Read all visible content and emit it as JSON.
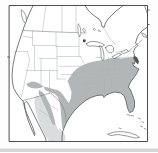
{
  "meta": {
    "type": "range-map"
  },
  "colors": {
    "background": "#fdfdfd",
    "map_interior": "#ffffff",
    "frame": "#4d4d4d",
    "coastline": "#565b5b",
    "state_lines": "#abb0b0",
    "international_border": "#7e8383",
    "primary_range_fill": "#b2b6b6",
    "secondary_range_fill": "#d9dddd",
    "dark_marker": "#3c4040",
    "coastal_patch": "#4f5454",
    "bottom_strip": "#d7d7d7"
  },
  "legend": {
    "primary_range": {
      "color": "#b2b6b6",
      "regions": [
        "southeastern United States",
        "eastern and central US west to the Great Plains",
        "Atlantic coast north to New Jersey",
        "Texas (except western wedge)",
        "southern Arizona and New Mexico",
        "northern Mexico and Sierra Madre"
      ]
    },
    "secondary_range": {
      "color": "#d9dddd",
      "regions": [
        "interior Mexico"
      ]
    },
    "point_markers": [
      {
        "name": "isolated-record-marker-northern-minnesota",
        "color": "#3c4040"
      },
      {
        "name": "dark-coastal-patch-new-jersey",
        "color": "#4f5454"
      }
    ]
  },
  "map": {
    "viewBox": "0 0 158 152",
    "layers": [
      {
        "name": "page-background",
        "d": "M0,0H158V152H0Z",
        "fill": "#fdfdfd"
      },
      {
        "name": "bottom-edge-strip",
        "d": "M0,148.5H158V152H0Z",
        "fill": "#d7d7d7"
      },
      {
        "name": "map-interior",
        "d": "M9.5,5.5H147.5V141.5H9.5Z",
        "fill": "#ffffff"
      },
      {
        "name": "range-secondary-mexico",
        "d": "M37,95 L41,98 L44,102 L47,107 L50,113 L53,119 L56,125 L59,131 L61,136 L61,141.5 L49,141.5 L45,135 L41,127 L38,119 L35.5,111 L34.5,103 L35,97 Z M59,128 L62,130 L64,133 L65.5,137 L65,141.5 L60,141.5 Z",
        "fill": "#d9dddd"
      },
      {
        "name": "range-primary-main",
        "d": "M134,57 L128,57.5 L121,58.5 L114,57.5 L107,59 L100,60.5 L94,61.5 L88,63 L82,65.5 L77,68.5 L73,72.5 L70,77 L67.5,81 L69.5,86 L71.5,92 L71,98 L69,103 L66.5,100 L63.5,95.5 L60.5,92 L57.5,90 L53,89 L48,87.5 L43.5,86.5 L45,90 L50,92 L55,94 L58,97 L59.5,102 L60.5,108 L61,114 L61.5,120 L62,126 L63,130 L64.5,127 L66.5,122.5 L70,116.5 L74.5,110.5 L80,105 L85.5,100.5 L91,97.5 L97,95.5 L102.5,95 L104,97.5 L105.5,95.5 L109.5,93.5 L115,92 L120.5,93 L124,95.5 L126,101 L127.5,108 L129.5,112.5 L132.5,111.5 L134.5,107 L134.5,101 L132.5,95 L130.5,90 L128.5,87 L129.5,84 L132,80 L135,76 L137.5,72 L139,69 L136,67.5 L133.5,66 L132.5,62.5 L134.5,64 L135,60.5 L133.5,58.5 Z",
        "fill": "#b2b6b6"
      },
      {
        "name": "range-primary-southwest",
        "d": "M28,83 L32,81.5 L36,82 L40,84 L43.5,86.5 L40,88 L36,88.5 L31.5,88 L28,86.5 L26.5,84.5 Z",
        "fill": "#b2b6b6"
      },
      {
        "name": "range-primary-sierra-madre",
        "d": "M39,90 L43,92.5 L46,97 L48.5,102 L51,108 L53,114 L54.5,120 L55.5,125.5 L52.5,124 L50,118.5 L47.5,112 L44.5,105.5 L41.5,99 L38.5,93.5 Z",
        "fill": "#b2b6b6"
      },
      {
        "name": "state-boundaries",
        "d": "M23.5,36.5 L33,37.5 M32.5,31 L32.5,45.5 M14.5,51.5 L28,51.5 M27.5,51.5 L29.5,60 L21.5,96.5 M34.5,45.5 L34.5,70.5 M33,45.5 L56,45.5 M56,33 L56,45.5 M57,45.5 L57,70.5 M39,58.5 L57,58.5 M41,58.5 L41,88 M26,70.5 L41,70.5 M41,70.5 L57,70.5 M49.5,70.5 L49.5,93.5 M57,70.5 L57,79 M57,79 L66,79 M56,46.5 L79,46.5 M57,56.5 L80.5,56.5 M79,33.5 L79,56.5 M60,66.5 L81,66 M80.5,56.5 L84,63.5 M61,74.5 L80,74.5 M84,70.5 L84,83.5 M84,77.5 L99,77.5 M84,83.5 L97.5,83.5 M86.5,83.5 L86.5,97.5 M97.5,83.5 L97.5,94.5 M104.5,77.5 L104.5,93.5 M111,75.5 L112,91 M98,71 L122,69 M98,75.5 L118,73.5 M96,57.5 L103,57.5 M103,57.5 L103,70.5 M108.5,57.5 L108.5,70 M114.5,56.5 L114.5,68 M116,57.5 L133,57 M116,52 L131,51 M118,68 L136,66 M117,74 L129,78.5 M112,91 L127,91 M62,5.5 L62,31.5 M76,5.5 L76,32.5 M46,5.5 L42.5,31 M103.5,27.5 L109.5,38 L116,45 M47,103 L58,110 M40,110 L52,119",
        "stroke": "#abb0b0",
        "strokeWidth": 0.5
      },
      {
        "name": "international-borders",
        "d": "M23.5,30.5 L45,31.5 L66,32.3 L86,33 M23,100.5 L31,98.5 L39,96.3 L46,94.3 L50.5,93 L54,96 L57.5,99 L60.5,102.5 L63,107 L64.8,112 L65.8,117.5 L66.3,123",
        "stroke": "#7e8383",
        "strokeWidth": 0.6
      },
      {
        "name": "st-lawrence-line",
        "d": "M128.5,51.5 L133,47.5 L138,43.5 L142,40",
        "stroke": "#6a6f6f",
        "strokeWidth": 0.5
      },
      {
        "name": "pacific-coastline",
        "d": "M33,5.5 L30,12 L27,19 L24,27 L21,36 L18,45 L15,55 L13,65 L12,75 L12.5,83 L14,89 L17,94 L20,98 L23,101 L24.5,107 L27,114 L30,121 L33,128 L35,134 L34.5,135.5 L32.5,131 L29.5,124 L27,117 L25,109 L24.5,103 L26,101.5 L28,103 L30,107 L33,113 L36,119 L39,125 L42,131 L45,137 L46.5,141.5",
        "stroke": "#565b5b",
        "strokeWidth": 0.8
      },
      {
        "name": "atlantic-gulf-coastline",
        "d": "M147.5,27 L143,30 L139,34 L137,38 L135.5,43 L138,45.5 L135,48 L133.5,52 L134.5,55 L133.5,58.5 L135,60.5 L134.5,64 L132.5,62.5 L133.5,66 L136,67.5 L139,69 L137.5,72 L135,76 L132,80 L129.5,84 L128.5,87 L130.5,90 L132.5,95 L134.5,101 L134.5,107 L132.5,111.5 L129.5,112.5 L127.5,108 L126,101 L124,95.5 L120.5,93 L115,92 L109.5,93.5 L105.5,95.5 L104,97.5 L102.5,95 L97,95.5 L91,97.5 L85.5,100.5 L80,105 L74.5,110.5 L70,116.5 L66.5,122.5 L64.5,127 L62.5,132 L62,137 L62,141.5",
        "stroke": "#565b5b",
        "strokeWidth": 0.8
      },
      {
        "name": "hudson-bay-coastline",
        "d": "M85,5.5 L88,10 L92,14 L96,17 L99,19 L101,22 L102,26.5 L104,27.5 L105.5,23 L108,19 L112,15 L116,11 L120,8 L123,5.5",
        "stroke": "#565b5b",
        "strokeWidth": 0.8
      },
      {
        "name": "labrador-coast-line",
        "d": "M144.5,5.5 L146,10 L147.5,14",
        "stroke": "#565b5b",
        "strokeWidth": 0.6
      },
      {
        "name": "vancouver-island",
        "d": "M21.5,10 L24,12 L26,16 L26.5,21 L25,23 L23,20 L21.5,15 Z",
        "fill": "#ffffff",
        "stroke": "#565b5b",
        "strokeWidth": 0.6
      },
      {
        "name": "nova-scotia",
        "d": "M142,33 L146,35 L147,37.5 L143.5,36.5 Z",
        "fill": "#ffffff",
        "stroke": "#565b5b",
        "strokeWidth": 0.6
      },
      {
        "name": "lake-superior",
        "d": "M86.5,43.5 Q90,40.5 95,41.5 Q101,42 104.5,45 Q103,47.5 98,46.5 Q92,45.5 88.5,46 Q86,45.5 86.5,43.5 Z",
        "fill": "#ffffff",
        "stroke": "#565b5b",
        "strokeWidth": 0.6
      },
      {
        "name": "lake-michigan",
        "d": "M99.5,46 Q101.5,50 101,55 Q100.8,58.5 102.5,60.5 Q104.5,59.5 103.8,54 Q103.2,49 101.5,46.5 Z",
        "fill": "#ffffff",
        "stroke": "#565b5b",
        "strokeWidth": 0.6
      },
      {
        "name": "lake-huron",
        "d": "M105.5,47.5 Q108,44.5 111.5,45.5 Q114.5,47 113.5,51 Q112,54 109,52.5 Q106,51 105.5,47.5 Z",
        "fill": "#ffffff",
        "stroke": "#565b5b",
        "strokeWidth": 0.6
      },
      {
        "name": "lake-erie",
        "d": "M112.5,56.5 L119,53 L121.5,54.5 L114.5,58.5 Z",
        "fill": "#ffffff",
        "stroke": "#565b5b",
        "strokeWidth": 0.6
      },
      {
        "name": "lake-ontario",
        "d": "M121.5,51.5 L126.5,49.5 L128.5,51.5 L123.5,53.5 Z",
        "fill": "#ffffff",
        "stroke": "#565b5b",
        "strokeWidth": 0.6
      },
      {
        "name": "lake-winnipeg",
        "d": "M78.5,24 L80.5,28 L80.8,34 L79.5,37 L78.2,32 L77.8,27 Z",
        "fill": "#ffffff",
        "stroke": "#565b5b",
        "strokeWidth": 0.5
      },
      {
        "name": "small-canadian-lakes",
        "d": "M83.5,28.5 L85.5,30 L84.5,32.5 L83,30.5 Z M94,28.5 l1.5,1 l-1,1 l-1,-1 Z M99,30 l1.5,1 l-1,1 l-1,-1 Z",
        "fill": "#ffffff",
        "stroke": "#565b5b",
        "strokeWidth": 0.5
      },
      {
        "name": "cuba",
        "d": "M108,134 L114,132 L121,131.5 L129,132.5 L136,135 L139.5,137.5 L135,138 L127,136 L118,134.5 L111,135.5 Z",
        "fill": "#ffffff",
        "stroke": "#565b5b",
        "strokeWidth": 0.6
      },
      {
        "name": "florida-keys-and-bahamas",
        "d": "M127,114.5 l2.5,0.8 M131,115.5 l2.5,0.5 M138.5,118 l2,1 M142,121.5 l1.8,1.2 M140.5,126 l2,0.8 M144.5,128.5 l1.5,0.8 M119,128 l2,0.6",
        "stroke": "#565b5b",
        "strokeWidth": 0.6
      },
      {
        "name": "dark-coastal-patch-new-jersey",
        "d": "M134.5,55.5 L137.5,58 L139,61.5 L138,64.5 L135.5,62 L133.8,58.5 Z",
        "fill": "#4f5454"
      },
      {
        "name": "isolated-record-marker",
        "d": "M83,39.5 h2.6 v2.6 h-2.6 Z",
        "fill": "#3c4040"
      },
      {
        "name": "map-frame",
        "d": "M9.5,5.5 H147.5 V141.5 H9.5 Z",
        "stroke": "#4d4d4d",
        "strokeWidth": 1
      },
      {
        "name": "frame-ticks",
        "d": "M147.5,10 h1.8 M147.5,24.5 h1.8 M9.5,57 h-1.8",
        "stroke": "#4d4d4d",
        "strokeWidth": 0.8
      }
    ]
  }
}
